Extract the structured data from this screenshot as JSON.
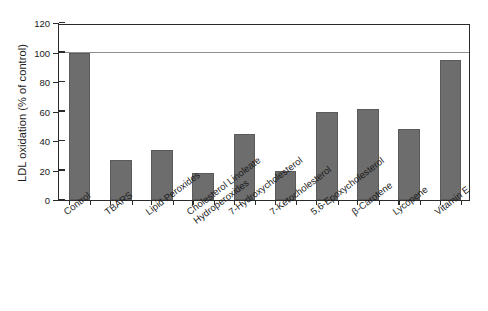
{
  "chart_data": {
    "type": "bar",
    "title": "",
    "xlabel": "",
    "ylabel": "LDL oxidation (% of control)",
    "ylim": [
      0,
      120
    ],
    "yticks": [
      0,
      20,
      40,
      60,
      80,
      100,
      120
    ],
    "ytick_labels": [
      "0",
      "20",
      "40",
      "60",
      "80",
      "100",
      "120"
    ],
    "grid": "horizontal gridline at y=100 only",
    "legend": "none",
    "bar_color": "#6d6d6d",
    "bar_edge_color": "#5a5a5a",
    "axis_color": "#2b2b2b",
    "background": "#ffffff",
    "categories": [
      "Control",
      "TBARS",
      "Lipid Peroxides",
      "Cholesterol Linoleate\nHydroperoxides",
      "7-Hydroxycholesterol",
      "7-Ketocholesterol",
      "5,6-Epoxycholesterol",
      "β-Carotene",
      "Lycopene",
      "Vitamin E"
    ],
    "values": [
      100,
      27,
      34,
      18,
      45,
      20,
      60,
      62,
      48,
      95
    ]
  }
}
